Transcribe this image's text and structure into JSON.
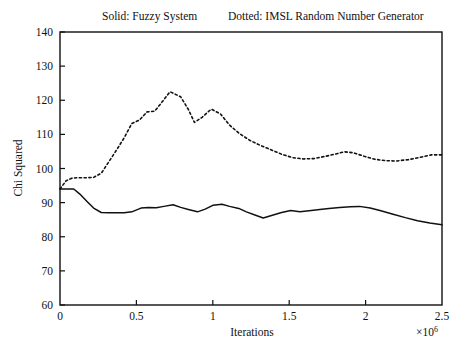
{
  "chart_data": {
    "type": "line",
    "title": "Solid: Fuzzy System        Dotted: IMSL Random Number Generator",
    "title_left": "Solid: Fuzzy System",
    "title_right": "Dotted: IMSL Random Number Generator",
    "xlabel": "Iterations",
    "ylabel": "Chi Squared",
    "x_multiplier": "×10",
    "x_multiplier_exponent": "6",
    "x_multiplier_full": "×10⁶",
    "xlim": [
      0,
      2.5
    ],
    "ylim": [
      60,
      140
    ],
    "grid": false,
    "legend_position": "title",
    "xticks": [
      0,
      0.5,
      1,
      1.5,
      2,
      2.5
    ],
    "xtick_labels": [
      "0",
      "0.5",
      "1",
      "1.5",
      "2",
      "2.5"
    ],
    "yticks": [
      60,
      70,
      80,
      90,
      100,
      110,
      120,
      130,
      140
    ],
    "ytick_labels": [
      "60",
      "70",
      "80",
      "90",
      "100",
      "110",
      "120",
      "130",
      "140"
    ],
    "series": [
      {
        "name": "Solid: Fuzzy System",
        "style": "solid",
        "color": "#111111",
        "x": [
          0.0,
          0.04,
          0.09,
          0.13,
          0.18,
          0.22,
          0.27,
          0.32,
          0.37,
          0.42,
          0.47,
          0.53,
          0.58,
          0.63,
          0.68,
          0.74,
          0.79,
          0.84,
          0.9,
          0.95,
          1.0,
          1.06,
          1.11,
          1.17,
          1.22,
          1.28,
          1.33,
          1.39,
          1.45,
          1.51,
          1.57,
          1.63,
          1.7,
          1.76,
          1.83,
          1.9,
          1.96,
          2.03,
          2.1,
          2.18,
          2.26,
          2.34,
          2.42,
          2.5
        ],
        "y": [
          94.0,
          94.0,
          94.0,
          92.5,
          90.2,
          88.4,
          87.1,
          87.0,
          87.0,
          87.0,
          87.3,
          88.4,
          88.6,
          88.5,
          88.9,
          89.4,
          88.6,
          88.0,
          87.3,
          88.1,
          89.2,
          89.5,
          88.9,
          88.3,
          87.3,
          86.3,
          85.5,
          86.3,
          87.1,
          87.7,
          87.3,
          87.6,
          88.0,
          88.3,
          88.6,
          88.8,
          88.9,
          88.4,
          87.6,
          86.6,
          85.6,
          84.7,
          84.0,
          83.5
        ]
      },
      {
        "name": "Dotted: IMSL Random Number Generator",
        "style": "dotted",
        "color": "#111111",
        "x": [
          0.0,
          0.04,
          0.08,
          0.12,
          0.17,
          0.22,
          0.27,
          0.32,
          0.37,
          0.42,
          0.47,
          0.52,
          0.57,
          0.62,
          0.67,
          0.72,
          0.79,
          0.84,
          0.88,
          0.93,
          0.99,
          1.05,
          1.11,
          1.17,
          1.24,
          1.31,
          1.38,
          1.45,
          1.52,
          1.59,
          1.66,
          1.73,
          1.8,
          1.86,
          1.92,
          1.99,
          2.06,
          2.13,
          2.2,
          2.28,
          2.36,
          2.43,
          2.5
        ],
        "y": [
          94.0,
          96.4,
          97.2,
          97.3,
          97.3,
          97.4,
          98.6,
          102.0,
          105.4,
          109.0,
          113.2,
          114.2,
          116.6,
          116.8,
          119.6,
          122.5,
          121.0,
          117.3,
          113.5,
          115.0,
          117.4,
          116.0,
          112.7,
          110.4,
          108.3,
          106.8,
          105.5,
          104.2,
          103.2,
          102.8,
          102.9,
          103.5,
          104.2,
          104.9,
          104.6,
          103.6,
          102.7,
          102.3,
          102.2,
          102.6,
          103.3,
          104.0,
          104.0
        ]
      }
    ]
  },
  "figure": {
    "plot_left_px": 60,
    "plot_right_px": 442,
    "plot_top_px": 32,
    "plot_bottom_px": 305
  }
}
